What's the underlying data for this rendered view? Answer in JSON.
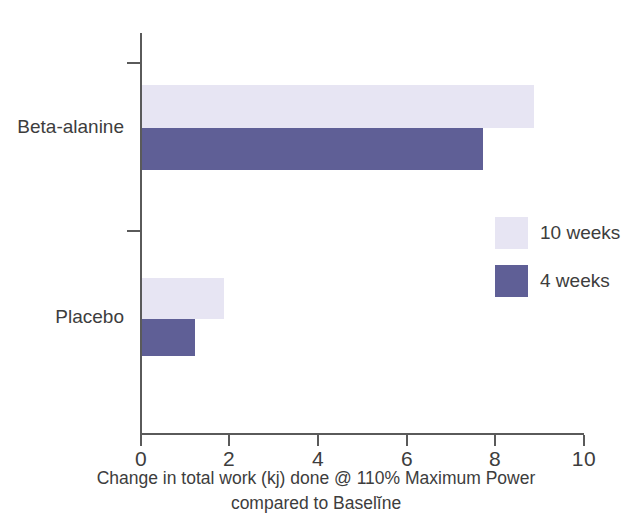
{
  "chart_data": {
    "type": "bar",
    "orientation": "horizontal",
    "title": "",
    "xlabel": "Change in total work (kj) done @ 110% Maximum Power compared to Baselĭne",
    "xlabel_lines": [
      "Change in total work (kj) done @ 110% Maximum Power",
      "compared to Baselĭne"
    ],
    "ylabel": "",
    "categories": [
      "Beta-alanine",
      "Placebo"
    ],
    "series": [
      {
        "name": "10 weeks",
        "color": "#e7e5f3",
        "values": [
          8.85,
          1.85
        ]
      },
      {
        "name": "4 weeks",
        "color": "#5f5f96",
        "values": [
          7.7,
          1.2
        ]
      }
    ],
    "xlim": [
      0,
      10
    ],
    "xticks": [
      0,
      2,
      4,
      6,
      8,
      10
    ],
    "xtick_labels": [
      "0",
      "2",
      "4",
      "6",
      "8",
      "10"
    ],
    "grid": false,
    "legend_position": "middle-right",
    "axis_color": "#5a5a5a"
  },
  "legend": {
    "items": [
      {
        "label": "10 weeks",
        "color": "#e7e5f3"
      },
      {
        "label": "4 weeks",
        "color": "#5f5f96"
      }
    ]
  }
}
